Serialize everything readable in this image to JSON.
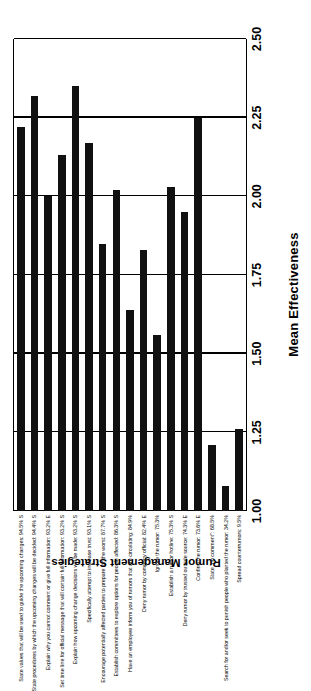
{
  "figure": {
    "x_axis_title": "Mean Effectiveness",
    "y_axis_title": "Rumor Management Strategies"
  },
  "chart_data": {
    "type": "bar",
    "orientation": "horizontal",
    "title": "",
    "xlabel": "Mean Effectiveness",
    "ylabel": "Rumor Management Strategies",
    "xlim": [
      1.0,
      2.5
    ],
    "ylim": null,
    "grid": true,
    "legend": null,
    "tick_labels": [
      "1.00",
      "1.25",
      "1.50",
      "1.75",
      "2.00",
      "2.25",
      "2.50"
    ],
    "ticks": [
      1.0,
      1.25,
      1.5,
      1.75,
      2.0,
      2.25,
      2.5
    ],
    "categories": [
      "State values that will be used to guide the upcoming changes: 94.5% S",
      "State procedures by which the upcoming changes will be decided: 94.4% S",
      "Explain why you cannot comment or give full information: 93.2% E",
      "Set time line for official message that will contain full information: 93.2% S",
      "Explain how upcoming change decisions will be made: 93.2% S",
      "Specifically attempt to increase trust: 93.1% S",
      "Encourage potentially affected parties to prepare for the worst: 87.7% S",
      "Establish committees to explore options for people affected: 86.3% S",
      "Have an employee inform you of rumors that are circulating: 84.9%",
      "Deny rumor by company official: 82.4% E",
      "Ignore the rumor: 75.3%",
      "Establish a rumor hotline: 75.3% S",
      "Deny rumor by trusted outside source: 74.3% E",
      "Confirm the rumor: 73.6% E",
      "State \"no comment\": 68.5%",
      "Search for and/or seek to punish people who planted the rumor: 34.2%",
      "Spread counterrumors: 9.5%"
    ],
    "values": [
      2.22,
      2.32,
      2.0,
      2.13,
      2.35,
      2.17,
      1.85,
      2.02,
      1.64,
      1.83,
      1.56,
      2.03,
      1.95,
      2.25,
      1.21,
      1.08,
      1.26
    ],
    "bar_color": "#111111"
  }
}
